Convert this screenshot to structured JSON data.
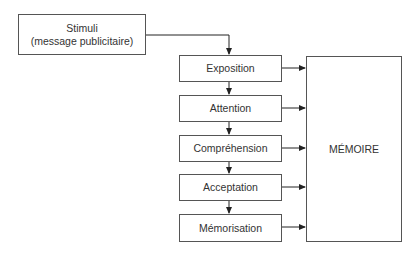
{
  "diagram": {
    "stimuli": {
      "line1": "Stimuli",
      "line2": "(message publicitaire)"
    },
    "stages": [
      {
        "label": "Exposition"
      },
      {
        "label": "Attention"
      },
      {
        "label": "Compréhension"
      },
      {
        "label": "Acceptation"
      },
      {
        "label": "Mémorisation"
      }
    ],
    "memory": {
      "label": "MÉMOIRE"
    }
  }
}
